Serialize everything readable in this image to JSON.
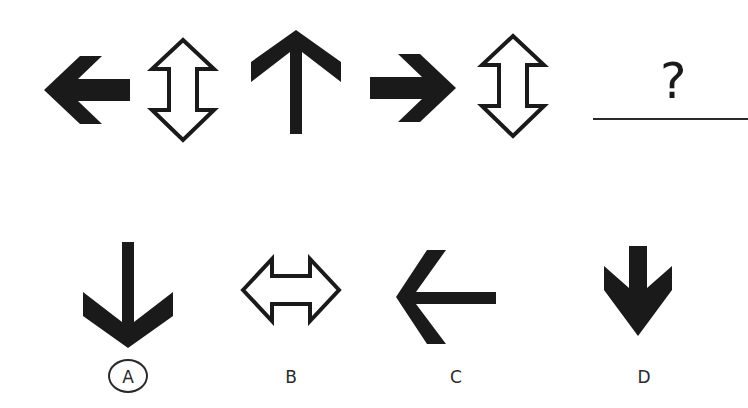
{
  "question": {
    "sequence": [
      {
        "position": 1,
        "shape": "solid-arrow-left",
        "style": "filled"
      },
      {
        "position": 2,
        "shape": "double-arrow-vertical",
        "style": "outline"
      },
      {
        "position": 3,
        "shape": "thin-arrow-up",
        "style": "filled"
      },
      {
        "position": 4,
        "shape": "solid-arrow-right",
        "style": "filled"
      },
      {
        "position": 5,
        "shape": "double-arrow-vertical",
        "style": "outline"
      }
    ],
    "missing_mark": "?"
  },
  "options": [
    {
      "label": "A",
      "shape": "thin-arrow-down",
      "selected": true
    },
    {
      "label": "B",
      "shape": "double-arrow-horizontal",
      "selected": false
    },
    {
      "label": "C",
      "shape": "thin-arrow-left",
      "selected": false
    },
    {
      "label": "D",
      "shape": "solid-arrow-down",
      "selected": false
    }
  ],
  "colors": {
    "ink": "#1a1a1a",
    "background": "#ffffff"
  }
}
